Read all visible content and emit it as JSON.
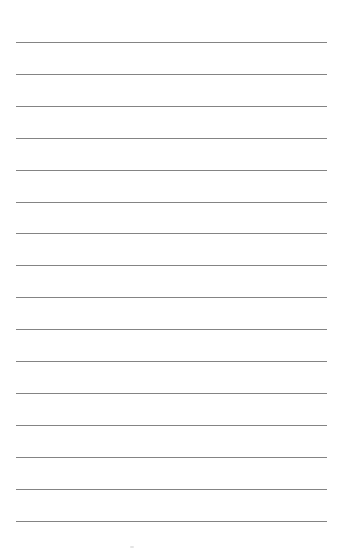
{
  "page": {
    "type": "lined-paper",
    "line_count": 16,
    "first_line_y": 42,
    "line_spacing": 31.9,
    "line_left": 16,
    "line_width": 311,
    "line_color": "#6e6e6e",
    "background": "#ffffff"
  }
}
